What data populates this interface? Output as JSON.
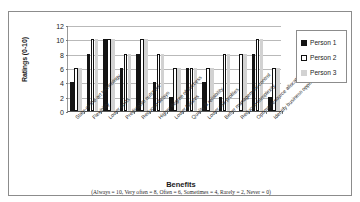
{
  "chart_data": {
    "type": "bar",
    "title": "",
    "xlabel": "Benefits",
    "xlabel_note": "(Always = 10, Very often = 8, Often  = 6, Sometimes = 4, Rarely = 2, Never = 0)",
    "ylabel": "Ratings (0-10)",
    "ylim": [
      0,
      12
    ],
    "yticks": [
      0,
      2,
      4,
      6,
      8,
      10,
      12
    ],
    "grid": true,
    "legend_position": "right",
    "categories": [
      "State-of-the-art technology",
      "Flexibility",
      "Lower costs",
      "Predictable outcome",
      "Reduced delays",
      "Higher degree of success",
      "Lower failures",
      "Quality & reliability",
      "Lower risk profiles",
      "Better management control",
      "Reduced complexity",
      "Optimal resource allocation",
      "Identify business opportunities"
    ],
    "series": [
      {
        "name": "Person 1",
        "color": "#141414",
        "values": [
          4,
          8,
          10,
          6,
          8,
          4,
          2,
          6,
          4,
          2,
          0,
          8,
          2
        ]
      },
      {
        "name": "Person 2",
        "color": "#ffffff",
        "values": [
          6,
          10,
          10,
          8,
          10,
          8,
          6,
          6,
          6,
          8,
          8,
          10,
          6
        ]
      },
      {
        "name": "Person 3",
        "color": "#d2d2d2",
        "values": [
          6,
          10,
          10,
          8,
          10,
          8,
          6,
          6,
          6,
          8,
          8,
          10,
          6
        ]
      }
    ]
  },
  "legend": {
    "items": [
      {
        "label": "Person 1"
      },
      {
        "label": "Person 2"
      },
      {
        "label": "Person 3"
      }
    ]
  }
}
